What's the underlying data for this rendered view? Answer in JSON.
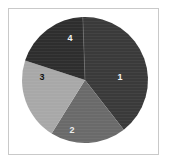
{
  "figure": {
    "background_color": "#ffffff",
    "frame_color": "#c9c9c9",
    "frame": {
      "x": 8,
      "y": 8,
      "width": 151,
      "height": 147
    }
  },
  "chart_data": {
    "type": "pie",
    "title": "",
    "subtitle": "",
    "xlabel": "",
    "ylabel": "",
    "grid": false,
    "legend_position": "none",
    "labels_inside_slices": true,
    "center": {
      "cx": 85,
      "cy": 80
    },
    "radius": 63,
    "start_angle_deg": -2,
    "direction": "clockwise",
    "categories": [
      "1",
      "2",
      "3",
      "4"
    ],
    "values": [
      40,
      20,
      21,
      19
    ],
    "value_unit": "percent",
    "slices": [
      {
        "label": "1",
        "value": 40,
        "start_deg": -2,
        "end_deg": 142,
        "color": "#3a3a3a",
        "label_color": "#f2f2f2",
        "label_x": 120,
        "label_y": 78
      },
      {
        "label": "2",
        "value": 20,
        "start_deg": 142,
        "end_deg": 212,
        "color": "#6a6a6a",
        "label_color": "#ededed",
        "label_x": 72,
        "label_y": 131
      },
      {
        "label": "3",
        "value": 21,
        "start_deg": 212,
        "end_deg": 288,
        "color": "#a8a8a8",
        "label_color": "#101010",
        "label_x": 42,
        "label_y": 78
      },
      {
        "label": "4",
        "value": 19,
        "start_deg": 288,
        "end_deg": 358,
        "color": "#2e2e2e",
        "label_color": "#f2f2f2",
        "label_x": 70,
        "label_y": 39
      }
    ],
    "seam_line": {
      "visible": true,
      "color": "#6f6f6f",
      "from_center_to_deg": -2
    }
  }
}
